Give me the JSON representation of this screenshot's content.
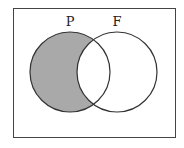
{
  "diagram": {
    "type": "venn",
    "sets": [
      {
        "label": "P",
        "shaded_region": "P only"
      },
      {
        "label": "F"
      }
    ],
    "shaded": "P minus F",
    "colors": {
      "shade": "#a9a9a9",
      "stroke": "#333333",
      "background": "#ffffff"
    }
  }
}
